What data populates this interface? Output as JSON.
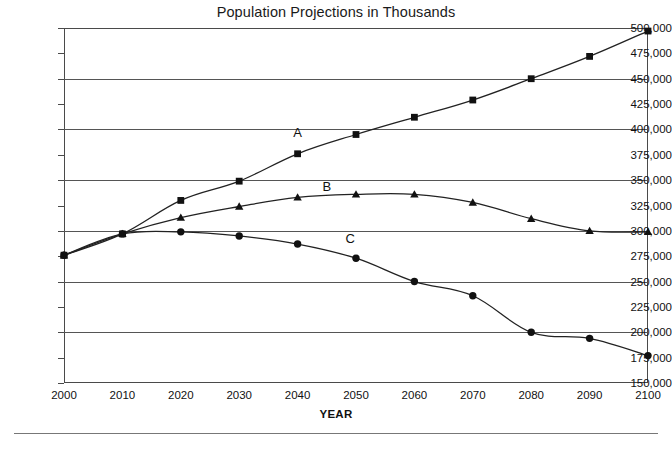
{
  "chart_data": {
    "type": "line",
    "title": "Population Projections in Thousands",
    "xlabel": "YEAR",
    "ylabel": "",
    "x": [
      2000,
      2010,
      2020,
      2030,
      2040,
      2050,
      2060,
      2070,
      2080,
      2090,
      2100
    ],
    "xtick_labels": [
      "2000",
      "2010",
      "2020",
      "2030",
      "2040",
      "2050",
      "2060",
      "2070",
      "2080",
      "2090",
      "2100"
    ],
    "ytick_labels": [
      "150,000",
      "175,000",
      "200,000",
      "225,000",
      "250,000",
      "275,000",
      "300,000",
      "325,000",
      "350,000",
      "375,000",
      "400,000",
      "425,000",
      "450,000",
      "475,000",
      "500,000"
    ],
    "ytick_values": [
      150000,
      175000,
      200000,
      225000,
      250000,
      275000,
      300000,
      325000,
      350000,
      375000,
      400000,
      425000,
      450000,
      475000,
      500000
    ],
    "ylim": [
      150000,
      500000
    ],
    "xlim": [
      2000,
      2100
    ],
    "gridlines_y": [
      200000,
      250000,
      300000,
      350000,
      400000,
      450000
    ],
    "grid": "horizontal-major-only",
    "legend": "inline-series-labels",
    "series": [
      {
        "name": "A",
        "marker": "square",
        "label_x": 2040,
        "label_value": 397000,
        "values": [
          276000,
          297000,
          330000,
          349000,
          376000,
          395000,
          412000,
          429000,
          450000,
          472000,
          497000
        ]
      },
      {
        "name": "B",
        "marker": "triangle",
        "label_x": 2045,
        "label_value": 344000,
        "values": [
          276000,
          297000,
          313000,
          324000,
          333000,
          336000,
          336000,
          328000,
          312000,
          300000,
          299000
        ]
      },
      {
        "name": "C",
        "marker": "circle",
        "label_x": 2049,
        "label_value": 293000,
        "values": [
          276000,
          297000,
          299000,
          295000,
          287000,
          273000,
          250000,
          236000,
          200000,
          194000,
          177000
        ]
      }
    ]
  },
  "colors": {
    "line": "#222222",
    "marker": "#111111",
    "grid": "#555555",
    "frame": "#4a4a4a",
    "text": "#111111",
    "background": "#ffffff"
  }
}
